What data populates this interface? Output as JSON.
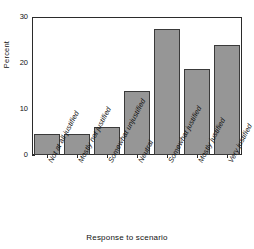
{
  "chart_data": {
    "type": "bar",
    "title": "",
    "xlabel": "Response to scenario",
    "ylabel": "Percent",
    "categories": [
      "Not at all justified",
      "Mostly not justified",
      "Somewhat unjustified",
      "Neutral",
      "Somewhat justified",
      "Mostly justified",
      "Very justified"
    ],
    "values": [
      4.5,
      4.5,
      6.0,
      14.0,
      27.5,
      18.7,
      24.0
    ],
    "ylim": [
      0,
      30
    ],
    "yticks": [
      0,
      10,
      20,
      30
    ],
    "ytick_labels": [
      "0",
      "10",
      "20",
      "30"
    ],
    "grid": false,
    "legend": null,
    "bar_color": "#969696",
    "bar_edge_color": "#3a3a3a",
    "axis_color": "#2b2b2b",
    "background": "#ffffff"
  }
}
